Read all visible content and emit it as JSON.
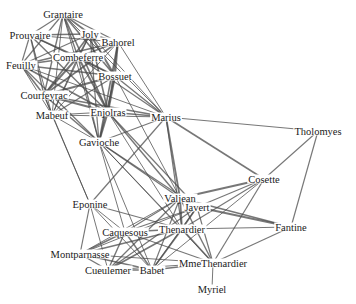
{
  "diagram": {
    "type": "network-graph",
    "nodes": [
      {
        "id": "Grantaire",
        "label": "Grantaire",
        "x": 63,
        "y": 14
      },
      {
        "id": "Prouvaire",
        "label": "Prouvaire",
        "x": 30,
        "y": 35
      },
      {
        "id": "Joly",
        "label": "Joly",
        "x": 90,
        "y": 34
      },
      {
        "id": "Bahorel",
        "label": "Bahorel",
        "x": 118,
        "y": 42
      },
      {
        "id": "Combeferre",
        "label": "Combeferre",
        "x": 78,
        "y": 57
      },
      {
        "id": "Feuilly",
        "label": "Feuilly",
        "x": 21,
        "y": 65
      },
      {
        "id": "Bossuet",
        "label": "Bossuet",
        "x": 115,
        "y": 76
      },
      {
        "id": "Courfeyrac",
        "label": "Courfeyrac",
        "x": 44,
        "y": 95
      },
      {
        "id": "Enjolras",
        "label": "Enjolras",
        "x": 108,
        "y": 112
      },
      {
        "id": "Mabeuf",
        "label": "Mabeuf",
        "x": 52,
        "y": 115
      },
      {
        "id": "Marius",
        "label": "Marius",
        "x": 166,
        "y": 117
      },
      {
        "id": "Gavroche",
        "label": "Gavioche",
        "x": 99,
        "y": 142
      },
      {
        "id": "Tholomyes",
        "label": "Tholomyes",
        "x": 318,
        "y": 131
      },
      {
        "id": "Cosette",
        "label": "Cosette",
        "x": 264,
        "y": 179
      },
      {
        "id": "Eponine",
        "label": "Eponine",
        "x": 90,
        "y": 204
      },
      {
        "id": "Valjean",
        "label": "Valjean",
        "x": 180,
        "y": 198
      },
      {
        "id": "Javert",
        "label": "Javert",
        "x": 197,
        "y": 207
      },
      {
        "id": "Claquesous",
        "label": "Caquesous",
        "x": 125,
        "y": 232
      },
      {
        "id": "Thenardier",
        "label": "Thenardier",
        "x": 182,
        "y": 229
      },
      {
        "id": "Fantine",
        "label": "Fantine",
        "x": 291,
        "y": 227
      },
      {
        "id": "Montparnasse",
        "label": "Montparnasse",
        "x": 80,
        "y": 254
      },
      {
        "id": "Gueulemer",
        "label": "Cueulemer",
        "x": 108,
        "y": 270
      },
      {
        "id": "Babet",
        "label": "Babet",
        "x": 152,
        "y": 270
      },
      {
        "id": "MmeThenardier",
        "label": "MmeThenardier",
        "x": 213,
        "y": 263
      },
      {
        "id": "Myriel",
        "label": "Myriel",
        "x": 212,
        "y": 289
      }
    ],
    "edges": [
      [
        "Grantaire",
        "Prouvaire",
        1.2
      ],
      [
        "Grantaire",
        "Joly",
        1.6
      ],
      [
        "Grantaire",
        "Bahorel",
        1.4
      ],
      [
        "Grantaire",
        "Combeferre",
        1.4
      ],
      [
        "Grantaire",
        "Feuilly",
        1.2
      ],
      [
        "Grantaire",
        "Bossuet",
        1.6
      ],
      [
        "Grantaire",
        "Courfeyrac",
        1.4
      ],
      [
        "Grantaire",
        "Enjolras",
        1.6
      ],
      [
        "Grantaire",
        "Mabeuf",
        1
      ],
      [
        "Grantaire",
        "Marius",
        1
      ],
      [
        "Grantaire",
        "Gavroche",
        1
      ],
      [
        "Prouvaire",
        "Joly",
        1.4
      ],
      [
        "Prouvaire",
        "Combeferre",
        1.4
      ],
      [
        "Prouvaire",
        "Feuilly",
        1.2
      ],
      [
        "Prouvaire",
        "Bossuet",
        1.2
      ],
      [
        "Prouvaire",
        "Courfeyrac",
        1.4
      ],
      [
        "Prouvaire",
        "Enjolras",
        1.4
      ],
      [
        "Prouvaire",
        "Bahorel",
        1.2
      ],
      [
        "Prouvaire",
        "Mabeuf",
        1
      ],
      [
        "Joly",
        "Bahorel",
        1.8
      ],
      [
        "Joly",
        "Combeferre",
        1.6
      ],
      [
        "Joly",
        "Feuilly",
        1.2
      ],
      [
        "Joly",
        "Bossuet",
        2
      ],
      [
        "Joly",
        "Courfeyrac",
        1.6
      ],
      [
        "Joly",
        "Enjolras",
        1.6
      ],
      [
        "Joly",
        "Mabeuf",
        1
      ],
      [
        "Joly",
        "Marius",
        1
      ],
      [
        "Joly",
        "Gavroche",
        1.2
      ],
      [
        "Bahorel",
        "Combeferre",
        1.6
      ],
      [
        "Bahorel",
        "Feuilly",
        1.4
      ],
      [
        "Bahorel",
        "Bossuet",
        1.8
      ],
      [
        "Bahorel",
        "Courfeyrac",
        1.6
      ],
      [
        "Bahorel",
        "Enjolras",
        1.6
      ],
      [
        "Bahorel",
        "Mabeuf",
        1
      ],
      [
        "Bahorel",
        "Marius",
        1
      ],
      [
        "Bahorel",
        "Gavroche",
        1.6
      ],
      [
        "Combeferre",
        "Feuilly",
        1.6
      ],
      [
        "Combeferre",
        "Bossuet",
        1.8
      ],
      [
        "Combeferre",
        "Courfeyrac",
        2
      ],
      [
        "Combeferre",
        "Enjolras",
        2
      ],
      [
        "Combeferre",
        "Mabeuf",
        1.2
      ],
      [
        "Combeferre",
        "Marius",
        1.2
      ],
      [
        "Combeferre",
        "Gavroche",
        1.4
      ],
      [
        "Feuilly",
        "Bossuet",
        1.4
      ],
      [
        "Feuilly",
        "Courfeyrac",
        1.6
      ],
      [
        "Feuilly",
        "Enjolras",
        1.6
      ],
      [
        "Feuilly",
        "Mabeuf",
        1
      ],
      [
        "Feuilly",
        "Marius",
        1
      ],
      [
        "Feuilly",
        "Gavroche",
        1.2
      ],
      [
        "Bossuet",
        "Courfeyrac",
        2
      ],
      [
        "Bossuet",
        "Enjolras",
        2
      ],
      [
        "Bossuet",
        "Mabeuf",
        1.2
      ],
      [
        "Bossuet",
        "Marius",
        1.4
      ],
      [
        "Bossuet",
        "Gavroche",
        1.4
      ],
      [
        "Bossuet",
        "Valjean",
        1
      ],
      [
        "Courfeyrac",
        "Enjolras",
        2
      ],
      [
        "Courfeyrac",
        "Mabeuf",
        1.2
      ],
      [
        "Courfeyrac",
        "Marius",
        1.4
      ],
      [
        "Courfeyrac",
        "Gavroche",
        1.6
      ],
      [
        "Courfeyrac",
        "Eponine",
        1
      ],
      [
        "Enjolras",
        "Mabeuf",
        1.2
      ],
      [
        "Enjolras",
        "Marius",
        1.6
      ],
      [
        "Enjolras",
        "Gavroche",
        1.8
      ],
      [
        "Enjolras",
        "Valjean",
        1.4
      ],
      [
        "Enjolras",
        "Javert",
        1.2
      ],
      [
        "Enjolras",
        "Thenardier",
        1
      ],
      [
        "Mabeuf",
        "Marius",
        1
      ],
      [
        "Mabeuf",
        "Gavroche",
        1
      ],
      [
        "Mabeuf",
        "Eponine",
        1
      ],
      [
        "Marius",
        "Tholomyes",
        1.2
      ],
      [
        "Marius",
        "Cosette",
        1.6
      ],
      [
        "Marius",
        "Gavroche",
        1.2
      ],
      [
        "Marius",
        "Eponine",
        1.2
      ],
      [
        "Marius",
        "Valjean",
        1.8
      ],
      [
        "Marius",
        "Thenardier",
        1.2
      ],
      [
        "Gavroche",
        "Valjean",
        1.2
      ],
      [
        "Gavroche",
        "Javert",
        1.2
      ],
      [
        "Gavroche",
        "Thenardier",
        1
      ],
      [
        "Gavroche",
        "MmeThenardier",
        1
      ],
      [
        "Gavroche",
        "Claquesous",
        1
      ],
      [
        "Gavroche",
        "Babet",
        1
      ],
      [
        "Tholomyes",
        "Cosette",
        1.2
      ],
      [
        "Tholomyes",
        "Fantine",
        1.2
      ],
      [
        "Cosette",
        "Valjean",
        1.8
      ],
      [
        "Cosette",
        "Javert",
        1.2
      ],
      [
        "Cosette",
        "Thenardier",
        1.2
      ],
      [
        "Cosette",
        "MmeThenardier",
        1.2
      ],
      [
        "Cosette",
        "Babet",
        1
      ],
      [
        "Eponine",
        "Thenardier",
        1.2
      ],
      [
        "Eponine",
        "Montparnasse",
        1.2
      ],
      [
        "Eponine",
        "Claquesous",
        1
      ],
      [
        "Eponine",
        "Gueulemer",
        1
      ],
      [
        "Eponine",
        "Babet",
        1
      ],
      [
        "Valjean",
        "Javert",
        2
      ],
      [
        "Valjean",
        "Thenardier",
        1.8
      ],
      [
        "Valjean",
        "Fantine",
        1.4
      ],
      [
        "Valjean",
        "MmeThenardier",
        1.4
      ],
      [
        "Valjean",
        "Claquesous",
        1.2
      ],
      [
        "Valjean",
        "Babet",
        1.2
      ],
      [
        "Valjean",
        "Gueulemer",
        1.2
      ],
      [
        "Valjean",
        "Montparnasse",
        1
      ],
      [
        "Javert",
        "Thenardier",
        1.6
      ],
      [
        "Javert",
        "Fantine",
        1.8
      ],
      [
        "Javert",
        "Claquesous",
        1.2
      ],
      [
        "Javert",
        "Babet",
        1.2
      ],
      [
        "Javert",
        "Gueulemer",
        1.2
      ],
      [
        "Javert",
        "MmeThenardier",
        1.2
      ],
      [
        "Javert",
        "Montparnasse",
        1
      ],
      [
        "Thenardier",
        "Fantine",
        1.2
      ],
      [
        "Thenardier",
        "MmeThenardier",
        1.6
      ],
      [
        "Thenardier",
        "Claquesous",
        1.4
      ],
      [
        "Thenardier",
        "Babet",
        1.6
      ],
      [
        "Thenardier",
        "Gueulemer",
        1.6
      ],
      [
        "Thenardier",
        "Montparnasse",
        1.4
      ],
      [
        "Fantine",
        "MmeThenardier",
        1.2
      ],
      [
        "Claquesous",
        "Montparnasse",
        1.4
      ],
      [
        "Claquesous",
        "Gueulemer",
        1.4
      ],
      [
        "Claquesous",
        "Babet",
        1.4
      ],
      [
        "Claquesous",
        "MmeThenardier",
        1.2
      ],
      [
        "Montparnasse",
        "Gueulemer",
        1.4
      ],
      [
        "Montparnasse",
        "Babet",
        1.4
      ],
      [
        "Montparnasse",
        "MmeThenardier",
        1
      ],
      [
        "Gueulemer",
        "Babet",
        1.6
      ],
      [
        "Gueulemer",
        "MmeThenardier",
        1.2
      ],
      [
        "Babet",
        "MmeThenardier",
        1.4
      ],
      [
        "MmeThenardier",
        "Myriel",
        1
      ]
    ]
  }
}
